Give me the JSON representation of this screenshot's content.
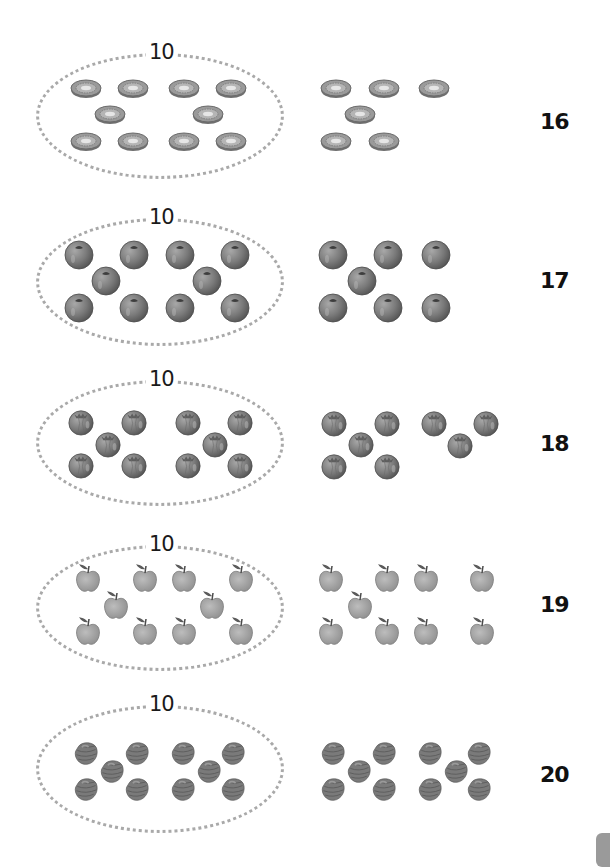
{
  "page": {
    "colors": {
      "dotted_ring": "#a9a9a9",
      "fruit_gray": "#808080",
      "label": "#111111",
      "tab": "#9a9a9a"
    }
  },
  "rows": [
    {
      "fruit": "kiwi-slice",
      "group_label": "10",
      "extra_count": 6,
      "total": "16"
    },
    {
      "fruit": "blueberry",
      "group_label": "10",
      "extra_count": 7,
      "total": "17"
    },
    {
      "fruit": "tomato",
      "group_label": "10",
      "extra_count": 8,
      "total": "18"
    },
    {
      "fruit": "apple",
      "group_label": "10",
      "extra_count": 9,
      "total": "19"
    },
    {
      "fruit": "strawberry",
      "group_label": "10",
      "extra_count": 10,
      "total": "20"
    }
  ]
}
